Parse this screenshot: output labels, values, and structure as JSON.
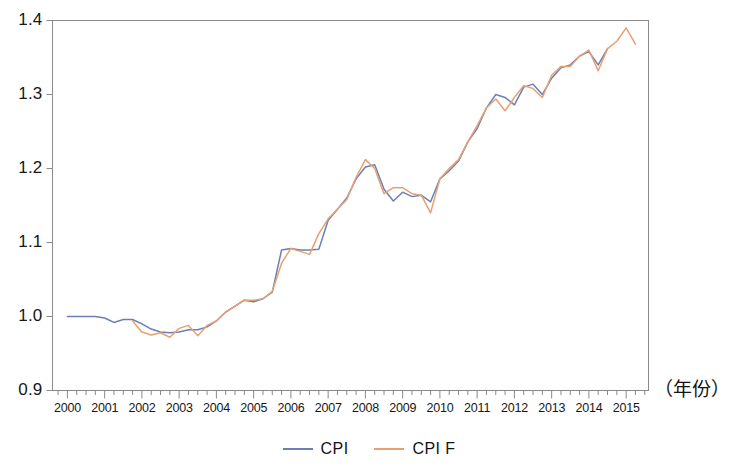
{
  "chart_data": {
    "type": "line",
    "title": "",
    "subtitle": "",
    "xlabel": "（年份）",
    "ylabel": "",
    "xlim": [
      1999.6,
      2015.6
    ],
    "ylim": [
      0.9,
      1.4
    ],
    "grid": false,
    "legend_position": "bottom-center",
    "y_ticks": [
      "0.9",
      "1.0",
      "1.1",
      "1.2",
      "1.3",
      "1.4"
    ],
    "y_tick_values": [
      0.9,
      1.0,
      1.1,
      1.2,
      1.3,
      1.4
    ],
    "x_ticks": [
      "2000",
      "2001",
      "2002",
      "2003",
      "2004",
      "2005",
      "2006",
      "2007",
      "2008",
      "2009",
      "2010",
      "2011",
      "2012",
      "2013",
      "2014",
      "2015"
    ],
    "x_tick_values": [
      2000,
      2001,
      2002,
      2003,
      2004,
      2005,
      2006,
      2007,
      2008,
      2009,
      2010,
      2011,
      2012,
      2013,
      2014,
      2015
    ],
    "x_minor_ticks_per_year": 4,
    "colors": {
      "cpi": "#6b7fb5",
      "cpi_f": "#e8a072",
      "axis": "#8a8a8a",
      "text": "#171717",
      "background": "#ffffff"
    },
    "series": [
      {
        "name": "CPI",
        "color": "#6b7fb5",
        "x": [
          2000.0,
          2000.25,
          2000.5,
          2000.75,
          2001.0,
          2001.25,
          2001.5,
          2001.75,
          2002.0,
          2002.25,
          2002.5,
          2002.75,
          2003.0,
          2003.25,
          2003.5,
          2003.75,
          2004.0,
          2004.25,
          2004.5,
          2004.75,
          2005.0,
          2005.25,
          2005.5,
          2005.75,
          2006.0,
          2006.25,
          2006.5,
          2006.75,
          2007.0,
          2007.25,
          2007.5,
          2007.75,
          2008.0,
          2008.25,
          2008.5,
          2008.75,
          2009.0,
          2009.25,
          2009.5,
          2009.75,
          2010.0,
          2010.25,
          2010.5,
          2010.75,
          2011.0,
          2011.25,
          2011.5,
          2011.75,
          2012.0,
          2012.25,
          2012.5,
          2012.75,
          2013.0,
          2013.25,
          2013.5,
          2013.75,
          2014.0,
          2014.25,
          2014.5
        ],
        "values": [
          1.0,
          1.0,
          1.0,
          1.0,
          0.998,
          0.992,
          0.996,
          0.996,
          0.99,
          0.983,
          0.979,
          0.978,
          0.979,
          0.982,
          0.982,
          0.986,
          0.994,
          1.006,
          1.014,
          1.022,
          1.02,
          1.024,
          1.033,
          1.09,
          1.092,
          1.09,
          1.09,
          1.091,
          1.13,
          1.145,
          1.16,
          1.186,
          1.202,
          1.205,
          1.172,
          1.156,
          1.168,
          1.162,
          1.164,
          1.155,
          1.186,
          1.197,
          1.21,
          1.236,
          1.254,
          1.282,
          1.3,
          1.296,
          1.286,
          1.31,
          1.314,
          1.3,
          1.322,
          1.336,
          1.34,
          1.352,
          1.358,
          1.34,
          1.362
        ]
      },
      {
        "name": "CPI F",
        "color": "#e8a072",
        "x": [
          2001.75,
          2002.0,
          2002.25,
          2002.5,
          2002.75,
          2003.0,
          2003.25,
          2003.5,
          2003.75,
          2004.0,
          2004.25,
          2004.5,
          2004.75,
          2005.0,
          2005.25,
          2005.5,
          2005.75,
          2006.0,
          2006.25,
          2006.5,
          2006.75,
          2007.0,
          2007.25,
          2007.5,
          2007.75,
          2008.0,
          2008.25,
          2008.5,
          2008.75,
          2009.0,
          2009.25,
          2009.5,
          2009.75,
          2010.0,
          2010.25,
          2010.5,
          2010.75,
          2011.0,
          2011.25,
          2011.5,
          2011.75,
          2012.0,
          2012.25,
          2012.5,
          2012.75,
          2013.0,
          2013.25,
          2013.5,
          2013.75,
          2014.0,
          2014.25,
          2014.5,
          2014.75,
          2015.0,
          2015.25
        ],
        "values": [
          0.994,
          0.979,
          0.975,
          0.978,
          0.972,
          0.984,
          0.988,
          0.974,
          0.988,
          0.994,
          1.006,
          1.014,
          1.022,
          1.022,
          1.024,
          1.034,
          1.072,
          1.092,
          1.088,
          1.084,
          1.112,
          1.132,
          1.145,
          1.158,
          1.188,
          1.212,
          1.2,
          1.166,
          1.174,
          1.174,
          1.166,
          1.164,
          1.14,
          1.186,
          1.2,
          1.212,
          1.236,
          1.258,
          1.282,
          1.294,
          1.278,
          1.296,
          1.312,
          1.308,
          1.296,
          1.326,
          1.338,
          1.338,
          1.352,
          1.36,
          1.332,
          1.362,
          1.372,
          1.39,
          1.368
        ]
      }
    ]
  },
  "axis": {
    "x_title": "（年份）"
  },
  "legend": {
    "items": [
      {
        "label": "CPI",
        "color": "#6b7fb5"
      },
      {
        "label": "CPI F",
        "color": "#e8a072"
      }
    ]
  }
}
